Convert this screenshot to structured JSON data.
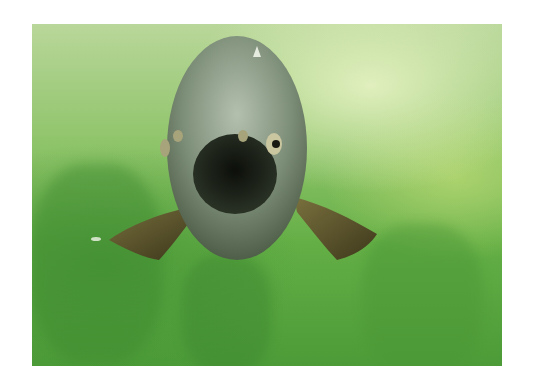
{
  "image": {
    "subject": "fish facing camera underwater",
    "background": "green murky water with aquatic plants",
    "colors": {
      "frame": "#ffffff",
      "water_light": "#d8e9b8",
      "water_mid": "#7fbe5a",
      "water_dark": "#4c9b38",
      "fish_body": "#7f8f7f",
      "fish_mouth": "#1a1f18",
      "fin": "#5a4a2c"
    }
  }
}
